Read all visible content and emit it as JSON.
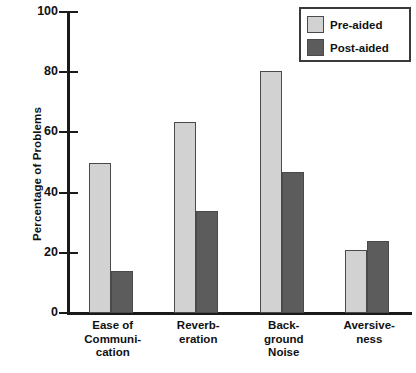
{
  "chart_data": {
    "type": "bar",
    "title": "",
    "xlabel": "",
    "ylabel": "Percentage of Problems",
    "ylim": [
      0,
      100
    ],
    "yticks": [
      0,
      20,
      40,
      60,
      80,
      100
    ],
    "ytick_labels": [
      "0",
      "20",
      "40",
      "60",
      "80",
      "100"
    ],
    "grid": false,
    "legend_position": "top-right",
    "categories": [
      "Ease of Communication",
      "Reverberation",
      "Background Noise",
      "Aversiveness"
    ],
    "category_label_lines": [
      [
        "Ease of",
        "Communi-",
        "cation"
      ],
      [
        "Reverb-",
        "eration"
      ],
      [
        "Back-",
        "ground",
        "Noise"
      ],
      [
        "Aversive-",
        "ness"
      ]
    ],
    "series": [
      {
        "name": "Pre-aided",
        "color": "#d2d2d2",
        "values": [
          50,
          63.5,
          80.5,
          21
        ]
      },
      {
        "name": "Post-aided",
        "color": "#5c5c5c",
        "values": [
          14,
          34,
          47,
          24
        ]
      }
    ]
  },
  "legend": {
    "items": [
      {
        "label": "Pre-aided"
      },
      {
        "label": "Post-aided"
      }
    ]
  },
  "colors": {
    "pre_aided": "#d2d2d2",
    "post_aided": "#5c5c5c",
    "axis": "#1a1a1a",
    "background": "#ffffff"
  }
}
